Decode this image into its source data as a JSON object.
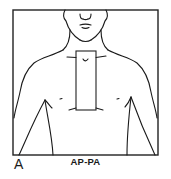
{
  "figure": {
    "panel_letter": "A",
    "projection_label": "AP-PA",
    "colors": {
      "line": "#1a1a1a",
      "background": "#ffffff"
    },
    "frame": {
      "x": 13,
      "y": 10,
      "width": 145,
      "height": 145
    },
    "field_rectangle": {
      "x": 76,
      "y": 51,
      "width": 20,
      "height": 59
    }
  }
}
